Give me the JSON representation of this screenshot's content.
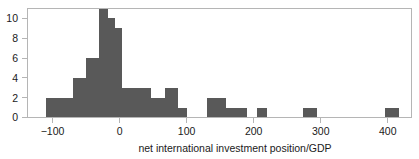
{
  "chart_data": {
    "type": "bar",
    "subtype": "histogram",
    "title": "",
    "xlabel": "net international investment position/GDP",
    "ylabel": "",
    "xlim": [
      -132,
      442
    ],
    "ylim": [
      0,
      11.6
    ],
    "xticks": [
      -100,
      0,
      100,
      200,
      300,
      400
    ],
    "xtick_labels": [
      "−100",
      "0",
      "100",
      "200",
      "300",
      "400"
    ],
    "yticks": [
      0,
      2,
      4,
      6,
      8,
      10
    ],
    "ytick_labels": [
      "0",
      "2",
      "4",
      "6",
      "8",
      "10"
    ],
    "grid": false,
    "legend": false,
    "bin_width": 20,
    "bar_color": "#595959",
    "bins": [
      {
        "x0": -110,
        "x1": -90,
        "count": 2
      },
      {
        "x0": -90,
        "x1": -70,
        "count": 2
      },
      {
        "x0": -70,
        "x1": -50,
        "count": 4
      },
      {
        "x0": -50,
        "x1": -40,
        "count": 6
      },
      {
        "x0": -40,
        "x1": -30,
        "count": 6
      },
      {
        "x0": -30,
        "x1": -17,
        "count": 11
      },
      {
        "x0": -17,
        "x1": -7,
        "count": 10
      },
      {
        "x0": -7,
        "x1": 3,
        "count": 9
      },
      {
        "x0": 3,
        "x1": 47,
        "count": 3
      },
      {
        "x0": 47,
        "x1": 67,
        "count": 2
      },
      {
        "x0": 67,
        "x1": 87,
        "count": 3
      },
      {
        "x0": 87,
        "x1": 100,
        "count": 1
      },
      {
        "x0": 130,
        "x1": 158,
        "count": 2
      },
      {
        "x0": 158,
        "x1": 190,
        "count": 1
      },
      {
        "x0": 205,
        "x1": 220,
        "count": 1
      },
      {
        "x0": 274,
        "x1": 294,
        "count": 1
      },
      {
        "x0": 396,
        "x1": 416,
        "count": 1
      }
    ],
    "counts": [
      2,
      2,
      4,
      6,
      6,
      11,
      10,
      9,
      3,
      2,
      3,
      1,
      2,
      1,
      1,
      1,
      1
    ],
    "categories": [
      "-110 to -90",
      "-90 to -70",
      "-70 to -50",
      "-50 to -40",
      "-40 to -30",
      "-30 to -17",
      "-17 to -7",
      "-7 to 3",
      "3 to 47",
      "47 to 67",
      "67 to 87",
      "87 to 100",
      "130 to 158",
      "158 to 190",
      "205 to 220",
      "274 to 294",
      "396 to 416"
    ]
  },
  "axis": {
    "x_title": "net international investment position/GDP"
  }
}
